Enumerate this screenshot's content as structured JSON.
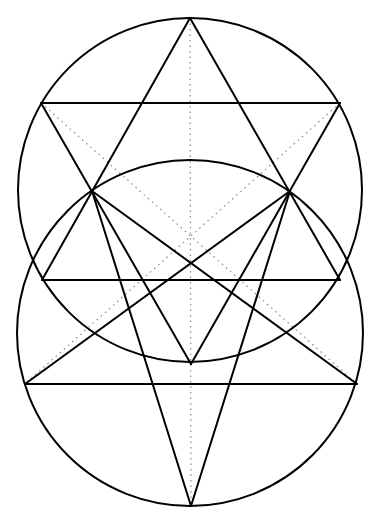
{
  "diagram": {
    "colors": {
      "stroke": "#000000",
      "construction": "#888888",
      "background": "#ffffff"
    },
    "circles": [
      {
        "name": "upper-circle",
        "cx": 190,
        "cy": 190,
        "r": 172
      },
      {
        "name": "lower-circle",
        "cx": 190,
        "cy": 333,
        "r": 173
      }
    ],
    "points": {
      "top": [
        190,
        18
      ],
      "hex_ul": [
        41,
        103
      ],
      "hex_ur": [
        340,
        103
      ],
      "hex_l": [
        92,
        191
      ],
      "hex_r": [
        290,
        191
      ],
      "hex_ll": [
        42,
        280
      ],
      "hex_lr": [
        340,
        280
      ],
      "hex_bottom": [
        191,
        364
      ],
      "pent_l": [
        25,
        384
      ],
      "pent_r": [
        357,
        384
      ],
      "bottom": [
        191,
        506
      ]
    },
    "solid_lines": [
      [
        "top",
        "hex_ll"
      ],
      [
        "top",
        "hex_lr"
      ],
      [
        "hex_ll",
        "hex_lr"
      ],
      [
        "hex_ul",
        "hex_ur"
      ],
      [
        "hex_ul",
        "hex_bottom"
      ],
      [
        "hex_ur",
        "hex_bottom"
      ],
      [
        "hex_l",
        "bottom"
      ],
      [
        "hex_r",
        "bottom"
      ],
      [
        "hex_l",
        "pent_r"
      ],
      [
        "hex_r",
        "pent_l"
      ],
      [
        "pent_l",
        "pent_r"
      ]
    ],
    "dotted_lines": [
      [
        "top",
        "bottom"
      ],
      [
        "hex_ul",
        "pent_r"
      ],
      [
        "hex_ur",
        "pent_l"
      ]
    ]
  }
}
